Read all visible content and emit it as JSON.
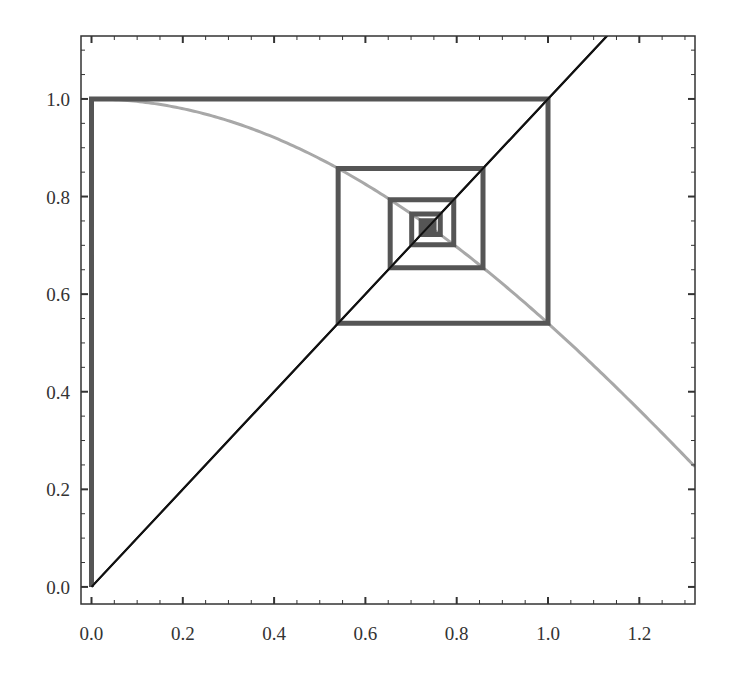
{
  "chart_data": {
    "type": "line",
    "title": "",
    "xlabel": "",
    "ylabel": "",
    "xlim": [
      -0.023,
      1.322
    ],
    "ylim": [
      -0.035,
      1.129
    ],
    "grid": false,
    "legend": null,
    "x_ticks": [
      0.0,
      0.2,
      0.4,
      0.6,
      0.8,
      1.0,
      1.2
    ],
    "x_tick_labels": [
      "0.0",
      "0.2",
      "0.4",
      "0.6",
      "0.8",
      "1.0",
      "1.2"
    ],
    "y_ticks": [
      0.0,
      0.2,
      0.4,
      0.6,
      0.8,
      1.0
    ],
    "y_tick_labels": [
      "0.0",
      "0.2",
      "0.4",
      "0.6",
      "0.8",
      "1.0"
    ],
    "series": [
      {
        "name": "cos(x)",
        "kind": "function",
        "function": "cos",
        "x_range": [
          0.0,
          1.32
        ],
        "color": "#a8a8a8",
        "width": 3
      },
      {
        "name": "y = x",
        "kind": "line",
        "x": [
          0.0,
          1.13
        ],
        "y": [
          0.0,
          1.13
        ],
        "color": "#111111",
        "width": 2
      },
      {
        "name": "cobweb iteration",
        "kind": "cobweb",
        "x0": 0.0,
        "iterates": [
          0.0,
          1.0,
          0.5403,
          0.8576,
          0.6543,
          0.7935,
          0.7014,
          0.764,
          0.7221,
          0.7504,
          0.7314,
          0.7442,
          0.7356,
          0.7414,
          0.7375,
          0.7401
        ],
        "color": "#555555",
        "width": 5
      }
    ]
  },
  "axes": {
    "frame_color": "#333333",
    "minor_ticks_per_major": 3
  }
}
